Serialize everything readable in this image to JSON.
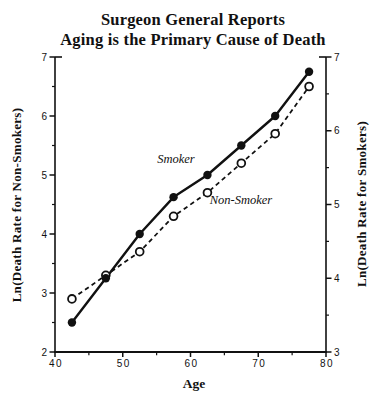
{
  "title": {
    "line1": "Surgeon General Reports",
    "line2": "Aging is the Primary Cause of Death"
  },
  "axes": {
    "x_label": "Age",
    "left_label": "Ln(Death Rate for Non-Smokers)",
    "right_label": "Ln(Death Rate for Smokers)"
  },
  "annotations": {
    "smoker": "Smoker",
    "non_smoker": "Non-Smoker"
  },
  "colors": {
    "ink": "#111111",
    "background": "#ffffff"
  },
  "chart_data": {
    "type": "line",
    "xlabel": "Age",
    "ylabel_left": "Ln(Death Rate for Non-Smokers)",
    "ylabel_right": "Ln(Death Rate for Smokers)",
    "grid": false,
    "legend_position": "inline-labels",
    "x_range": [
      40,
      80
    ],
    "x_major_ticks": [
      40,
      50,
      60,
      70,
      80
    ],
    "x_minor_ticks": [
      45,
      55,
      65,
      75
    ],
    "left_axis_range": [
      2,
      7
    ],
    "left_major_ticks": [
      2,
      3,
      4,
      5,
      6,
      7
    ],
    "left_minor_ticks": [
      2.5,
      3.5,
      4.5,
      5.5,
      6.5
    ],
    "right_axis_range": [
      3,
      7
    ],
    "right_major_ticks": [
      3,
      4,
      5,
      6,
      7
    ],
    "right_minor_ticks": [
      3.5,
      4.5,
      5.5,
      6.5
    ],
    "x": [
      42.5,
      47.5,
      52.5,
      57.5,
      62.5,
      67.5,
      72.5,
      77.5
    ],
    "series": [
      {
        "name": "Smoker",
        "axis": "right",
        "line": "solid",
        "marker": "filled-circle",
        "values": [
          3.4,
          4.0,
          4.6,
          5.1,
          5.4,
          5.8,
          6.2,
          6.8
        ]
      },
      {
        "name": "Non-Smoker",
        "axis": "left",
        "line": "dashed",
        "marker": "open-circle",
        "values": [
          2.9,
          3.3,
          3.7,
          4.3,
          4.7,
          5.2,
          5.7,
          6.5
        ]
      }
    ]
  }
}
